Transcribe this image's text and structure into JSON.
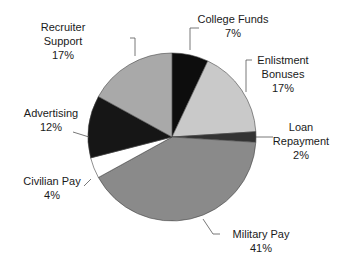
{
  "chart_data": {
    "type": "pie",
    "title": "",
    "start_angle_deg": 0,
    "direction": "clockwise",
    "slices": [
      {
        "label": "College Funds",
        "value": 7,
        "display": "7%",
        "color": "#0d0d0d"
      },
      {
        "label": "Enlistment Bonuses",
        "value": 17,
        "display": "17%",
        "color": "#c9c9c9"
      },
      {
        "label": "Loan Repayment",
        "value": 2,
        "display": "2%",
        "color": "#333333"
      },
      {
        "label": "Military Pay",
        "value": 41,
        "display": "41%",
        "color": "#8a8a8a"
      },
      {
        "label": "Civilian Pay",
        "value": 4,
        "display": "4%",
        "color": "#ffffff"
      },
      {
        "label": "Advertising",
        "value": 12,
        "display": "12%",
        "color": "#161616"
      },
      {
        "label": "Recruiter Support",
        "value": 17,
        "display": "17%",
        "color": "#a9a9a9"
      }
    ],
    "legend": "none (callout labels with leader lines)"
  },
  "labels": {
    "recruiter_support": {
      "line1": "Recruiter",
      "line2": "Support",
      "pct": "17%"
    },
    "college_funds": {
      "line1": "College Funds",
      "pct": "7%"
    },
    "enlistment_bonuses": {
      "line1": "Enlistment",
      "line2": "Bonuses",
      "pct": "17%"
    },
    "loan_repayment": {
      "line1": "Loan",
      "line2": "Repayment",
      "pct": "2%"
    },
    "military_pay": {
      "line1": "Military Pay",
      "pct": "41%"
    },
    "civilian_pay": {
      "line1": "Civilian Pay",
      "pct": "4%"
    },
    "advertising": {
      "line1": "Advertising",
      "pct": "12%"
    }
  }
}
